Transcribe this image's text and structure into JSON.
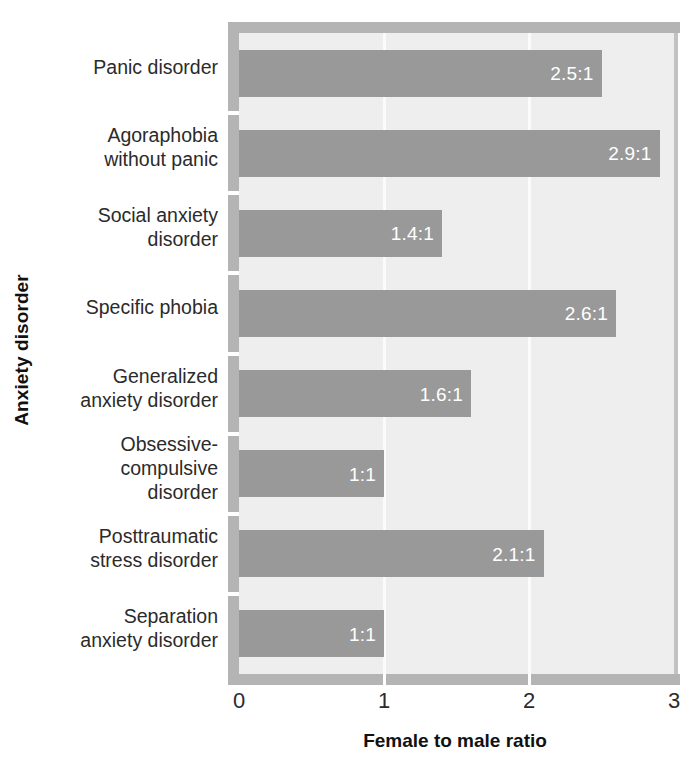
{
  "chart_data": {
    "type": "bar",
    "orientation": "horizontal",
    "title": "",
    "xlabel": "Female to male ratio",
    "ylabel": "Anxiety disorder",
    "xlim": [
      0,
      3
    ],
    "xticks": [
      "0",
      "1",
      "2",
      "3"
    ],
    "xtick_values": [
      0,
      1,
      2,
      3
    ],
    "grid": "vertical-white-gridlines-at-1-and-2",
    "legend": "none",
    "categories": [
      "Panic disorder",
      "Agoraphobia\nwithout panic",
      "Social anxiety\ndisorder",
      "Specific phobia",
      "Generalized\nanxiety disorder",
      "Obsessive-\ncompulsive\ndisorder",
      "Posttraumatic\nstress disorder",
      "Separation\nanxiety disorder"
    ],
    "values": [
      2.5,
      2.9,
      1.4,
      2.6,
      1.6,
      1.0,
      2.1,
      1.0
    ],
    "value_labels": [
      "2.5:1",
      "2.9:1",
      "1.4:1",
      "2.6:1",
      "1.6:1",
      "1:1",
      "2.1:1",
      "1:1"
    ],
    "colors": {
      "bar": "#999999",
      "plot_background": "#eeeeee",
      "axis_rule": "#b4b4b4",
      "gridline": "#fbfbfb",
      "value_label_text": "#ffffff",
      "axis_text": "#2b2b2b",
      "page_background": "#ffffff"
    }
  },
  "axes": {
    "y_title": "Anxiety disorder",
    "x_title": "Female to male ratio"
  },
  "categories": [
    {
      "label": "Panic disorder",
      "value": 2.5,
      "value_label": "2.5:1"
    },
    {
      "label": "Agoraphobia\nwithout panic",
      "value": 2.9,
      "value_label": "2.9:1"
    },
    {
      "label": "Social anxiety\ndisorder",
      "value": 1.4,
      "value_label": "1.4:1"
    },
    {
      "label": "Specific phobia",
      "value": 2.6,
      "value_label": "2.6:1"
    },
    {
      "label": "Generalized\nanxiety disorder",
      "value": 1.6,
      "value_label": "1.6:1"
    },
    {
      "label": "Obsessive-\ncompulsive\ndisorder",
      "value": 1.0,
      "value_label": "1:1"
    },
    {
      "label": "Posttraumatic\nstress disorder",
      "value": 2.1,
      "value_label": "2.1:1"
    },
    {
      "label": "Separation\nanxiety disorder",
      "value": 1.0,
      "value_label": "1:1"
    }
  ],
  "x_ticks": [
    {
      "label": "0",
      "value": 0
    },
    {
      "label": "1",
      "value": 1
    },
    {
      "label": "2",
      "value": 2
    },
    {
      "label": "3",
      "value": 3
    }
  ]
}
